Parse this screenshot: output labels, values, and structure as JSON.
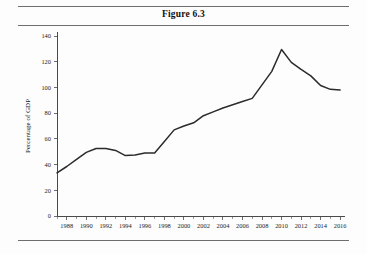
{
  "figure": {
    "title": "Figure 6.3"
  },
  "chart_data": {
    "type": "line",
    "title": "Figure 6.3",
    "xlabel": "",
    "ylabel": "Percentage of GDP",
    "xlim": [
      1987,
      2016.5
    ],
    "ylim": [
      0,
      140
    ],
    "grid": false,
    "legend": null,
    "y_ticks": [
      0,
      20,
      40,
      60,
      80,
      100,
      120,
      140
    ],
    "y_tick_labels": [
      "0",
      "20",
      "40",
      "60",
      "80",
      "100",
      "120",
      "140"
    ],
    "x_ticks": [
      1988,
      1990,
      1992,
      1994,
      1996,
      1998,
      2000,
      2002,
      2004,
      2006,
      2008,
      2010,
      2012,
      2014,
      2016
    ],
    "x_tick_labels": [
      "1988",
      "1990",
      "1992",
      "1994",
      "1996",
      "1998",
      "2000",
      "2002",
      "2004",
      "2006",
      "2008",
      "2010",
      "2012",
      "2014",
      "2016"
    ],
    "x_minor_ticks": [
      1987,
      1989,
      1991,
      1993,
      1995,
      1997,
      1999,
      2001,
      2003,
      2005,
      2007,
      2009,
      2011,
      2013,
      2015
    ],
    "series": [
      {
        "name": "Debt as percentage of GDP",
        "color": "#2b2b2b",
        "x": [
          1987,
          1988,
          1989,
          1990,
          1991,
          1992,
          1993,
          1994,
          1995,
          1996,
          1997,
          1998,
          1999,
          2000,
          2001,
          2002,
          2003,
          2004,
          2005,
          2006,
          2007,
          2008,
          2009,
          2010,
          2011,
          2012,
          2013,
          2014,
          2015,
          2016
        ],
        "values": [
          33.5,
          38.5,
          44.0,
          49.5,
          52.5,
          52.5,
          51.0,
          47.0,
          47.5,
          49.0,
          49.0,
          58.0,
          67.0,
          70.0,
          72.5,
          78.0,
          81.0,
          84.0,
          86.5,
          89.0,
          91.5,
          102.0,
          112.5,
          129.5,
          119.5,
          114.0,
          109.0,
          101.5,
          98.5,
          98.0
        ]
      }
    ]
  },
  "axis": {
    "y_title": "Percentage of GDP"
  }
}
